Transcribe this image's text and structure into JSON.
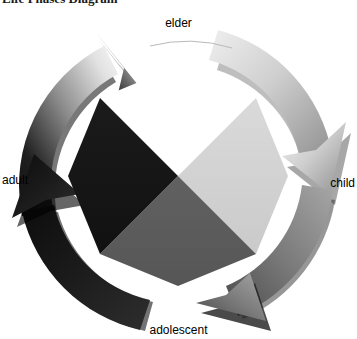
{
  "heading": {
    "text": "Life Phases Diagram",
    "note": "clipped at top edge of screenshot"
  },
  "diagram": {
    "type": "cycle",
    "direction": "clockwise",
    "background_color": "#ffffff",
    "labels": {
      "top": "elder",
      "right": "child",
      "bottom": "adolescent",
      "left": "adult"
    },
    "segments": [
      {
        "name": "elder",
        "position": "top",
        "wedge_fill": "#ffffff",
        "arrow_fill_start": "#1f1f1f",
        "arrow_fill_end": "#f2f2f2",
        "arrow_quadrant": "top-left",
        "points_to": "elder"
      },
      {
        "name": "child",
        "position": "right",
        "wedge_fill": "#d2d2d2",
        "arrow_fill_start": "#ededed",
        "arrow_fill_end": "#9a9a9a",
        "arrow_quadrant": "top-right",
        "points_to": "child"
      },
      {
        "name": "adolescent",
        "position": "bottom",
        "wedge_fill": "#5a5a5a",
        "arrow_fill_start": "#9e9e9e",
        "arrow_fill_end": "#4a4a4a",
        "arrow_quadrant": "bottom-right",
        "points_to": "adolescent"
      },
      {
        "name": "adult",
        "position": "left",
        "wedge_fill": "#161616",
        "arrow_fill_start": "#2b2b2b",
        "arrow_fill_end": "#101010",
        "arrow_quadrant": "bottom-left",
        "points_to": "adult"
      }
    ],
    "colors": {
      "wedge_elder": "#ffffff",
      "wedge_child": "#d2d2d2",
      "wedge_adolescent": "#5a5a5a",
      "wedge_adult": "#161616",
      "outline": "#8c8c8c",
      "shadow": "#3a3a3a"
    }
  }
}
